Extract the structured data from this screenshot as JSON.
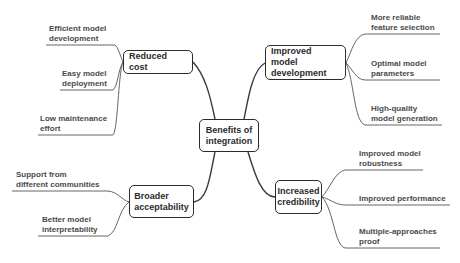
{
  "diagram": {
    "type": "mind-map",
    "central": {
      "label": "Benefits of\nintegration"
    },
    "branches": [
      {
        "label": "Reduced cost",
        "side": "left",
        "children": [
          "Efficient model\ndevelopment",
          "Easy model\ndeployment",
          "Low maintenance\neffort"
        ]
      },
      {
        "label": "Improved model\ndevelopment",
        "side": "right",
        "children": [
          "More reliable\nfeature selection",
          "Optimal model\nparameters",
          "High-quality\nmodel generation"
        ]
      },
      {
        "label": "Broader\nacceptability",
        "side": "left",
        "children": [
          "Support from\ndifferent communities",
          "Better model\ninterpretability"
        ]
      },
      {
        "label": "Increased\ncredibility",
        "side": "right",
        "children": [
          "Improved model\nrobustness",
          "Improved performance",
          "Multiple-approaches\nproof"
        ]
      }
    ],
    "colors": {
      "node_border": "#2b2b2b",
      "leaf_text": "#4a4a4a",
      "line": "#3a3a3a",
      "background": "#ffffff"
    }
  }
}
